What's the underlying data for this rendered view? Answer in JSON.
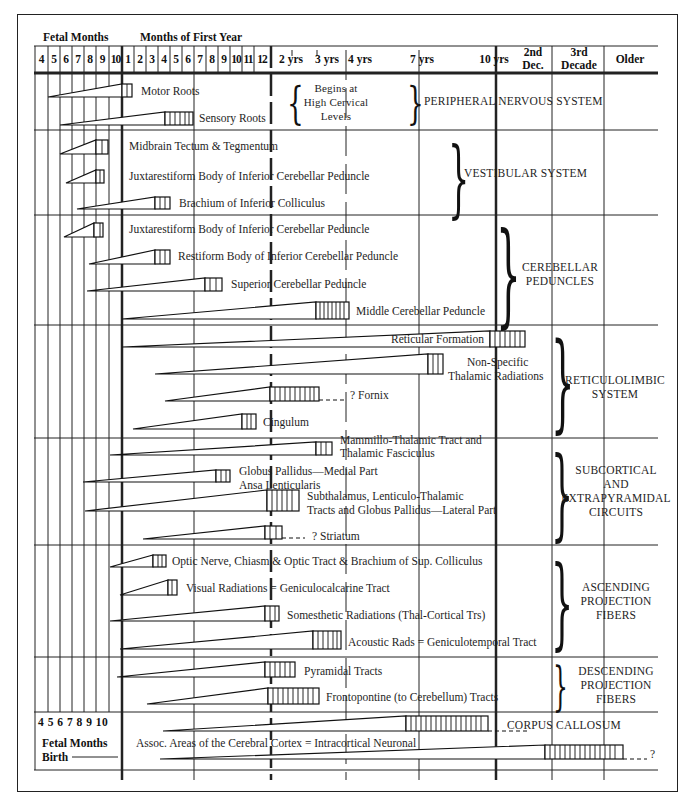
{
  "header": {
    "fetal_title": "Fetal Months",
    "first_year_title": "Months of First Year",
    "fetal_months": [
      "4",
      "5",
      "6",
      "7",
      "8",
      "9",
      "10"
    ],
    "first_year_months": [
      "1",
      "2",
      "3",
      "4",
      "5",
      "6",
      "7",
      "8",
      "9",
      "10",
      "11",
      "12"
    ],
    "later": [
      "2 yrs",
      "3 yrs",
      "4 yrs",
      "7 yrs",
      "10 yrs"
    ],
    "decades": [
      "2nd Dec.",
      "3rd Decade",
      "Older"
    ]
  },
  "sections": [
    {
      "id": "pns",
      "title": "PERIPHERAL NERVOUS SYSTEM",
      "note": [
        "Begins at",
        "High Cervical",
        "Levels"
      ],
      "tracts": [
        "Motor Roots",
        "Sensory Roots"
      ]
    },
    {
      "id": "vestibular",
      "title": "VESTIBULAR SYSTEM",
      "tracts": [
        "Midbrain Tectum & Tegmentum",
        "Juxtarestiform Body of Inferior Cerebellar Peduncle",
        "Brachium of Inferior Colliculus"
      ]
    },
    {
      "id": "cerebellar",
      "title": [
        "CEREBELLAR",
        "PEDUNCLES"
      ],
      "tracts": [
        "Juxtarestiform Body of Inferior Cerebellar Peduncle",
        "Restiform Body of Inferior Cerebellar Peduncle",
        "Superior Cerebellar Peduncle",
        "Middle Cerebellar Peduncle"
      ]
    },
    {
      "id": "reticulolimbic",
      "title": [
        "RETICULOLIMBIC",
        "SYSTEM"
      ],
      "tracts": [
        "Reticular Formation",
        "Non-Specific",
        "Thalamic Radiations",
        "? Fornix",
        "Cingulum"
      ]
    },
    {
      "id": "subcortical",
      "title": [
        "SUBCORTICAL",
        "AND",
        "EXTRAPYRAMIDAL",
        "CIRCUITS"
      ],
      "tracts": [
        "Mammillo-Thalamic Tract and",
        "Thalamic Fasciculus",
        "Globus Pallidus—Medial Part",
        "Ansa Lenticularis",
        "Subthalamus, Lenticulo-Thalamic",
        "Tracts and Globus Pallidus—Lateral Part",
        "? Striatum"
      ]
    },
    {
      "id": "ascending",
      "title": [
        "ASCENDING",
        "PROJECTION",
        "FIBERS"
      ],
      "tracts": [
        "Optic Nerve, Chiasm & Optic Tract & Brachium of Sup. Colliculus",
        "Visual Radiations = Geniculocalcarine Tract",
        "Somesthetic Radiations (Thal-Cortical Trs)",
        "Acoustic Rads = Geniculotemporal Tract"
      ]
    },
    {
      "id": "descending",
      "title": [
        "DESCENDING",
        "PROJECTION",
        "FIBERS"
      ],
      "tracts": [
        "Pyramidal Tracts",
        "Frontopontine (to Cerebellum) Tracts"
      ]
    },
    {
      "id": "commissural",
      "title": "CORPUS CALLOSUM",
      "tracts": [
        "Assoc. Areas of the Cerebral Cortex = Intracortical Neuronal",
        "?"
      ]
    }
  ],
  "footer": {
    "fetal_numbers": "4 5 6 7 8 9 10",
    "fetal_label": "Fetal Months",
    "birth_label": "Birth"
  }
}
